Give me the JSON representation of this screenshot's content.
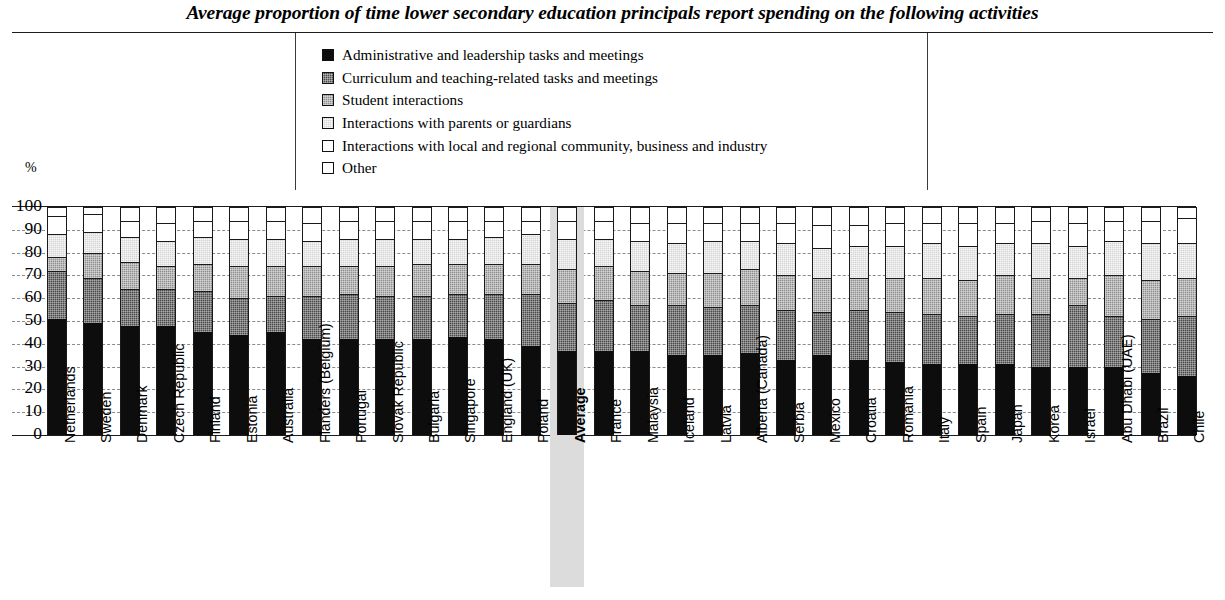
{
  "title": "Average proportion of time lower secondary education principals report spending on the following activities",
  "axis": {
    "y_unit": "%",
    "y_ticks": [
      "100",
      "90",
      "80",
      "70",
      "60",
      "50",
      "40",
      "30",
      "20",
      "10",
      "0"
    ]
  },
  "legend": {
    "items": [
      {
        "label": "Administrative and leadership tasks and meetings",
        "swatch": "black-filled-swatch",
        "color": "#0d0d0d"
      },
      {
        "label": "Curriculum and teaching-related tasks and meetings",
        "swatch": "dark-gray-hatch-swatch",
        "color": "#4a4a4a"
      },
      {
        "label": "Student interactions",
        "swatch": "medium-gray-hatch-swatch",
        "color": "#8e8e8e"
      },
      {
        "label": "Interactions with parents or guardians",
        "swatch": "light-gray-hatch-swatch",
        "color": "#d4d4d4"
      },
      {
        "label": "Interactions with local and regional community, business and industry",
        "swatch": "white-swatch",
        "color": "#ffffff"
      },
      {
        "label": "Other",
        "swatch": "white-swatch",
        "color": "#ffffff"
      }
    ]
  },
  "chart_data": {
    "type": "bar",
    "stacked": true,
    "title": "Average proportion of time lower secondary education principals report spending on the following activities",
    "xlabel": "",
    "ylabel": "%",
    "ylim": [
      0,
      100
    ],
    "yticks": [
      0,
      10,
      20,
      30,
      40,
      50,
      60,
      70,
      80,
      90,
      100
    ],
    "grid": true,
    "legend_position": "top-center",
    "highlight_category": "Average",
    "categories": [
      "Netherlands",
      "Sweden",
      "Denmark",
      "Czech Republic",
      "Finland",
      "Estonia",
      "Australia",
      "Flanders (Belgium)",
      "Portugal",
      "Slovak Republic",
      "Bulgaria",
      "Singapore",
      "England (UK)",
      "Poland",
      "Average",
      "France",
      "Malaysia",
      "Iceland",
      "Latvia",
      "Alberta (Canada)",
      "Serbia",
      "Mexico",
      "Croatia",
      "Romania",
      "Italy",
      "Spain",
      "Japan",
      "Korea",
      "Israel",
      "Abu Dhabi (UAE)",
      "Brazil",
      "Chile"
    ],
    "series": [
      {
        "name": "Administrative and leadership tasks and meetings",
        "color": "#0d0d0d",
        "values": [
          51,
          49,
          48,
          48,
          45,
          44,
          45,
          42,
          42,
          42,
          42,
          43,
          42,
          39,
          37,
          37,
          37,
          35,
          35,
          36,
          33,
          35,
          33,
          32,
          31,
          31,
          31,
          30,
          30,
          30,
          27,
          26
        ]
      },
      {
        "name": "Curriculum and teaching-related tasks and meetings",
        "color": "#4a4a4a",
        "values": [
          21,
          20,
          16,
          16,
          18,
          16,
          16,
          19,
          20,
          19,
          19,
          19,
          20,
          23,
          21,
          22,
          20,
          22,
          21,
          21,
          22,
          19,
          22,
          22,
          22,
          21,
          22,
          23,
          27,
          22,
          24,
          26
        ]
      },
      {
        "name": "Student interactions",
        "color": "#8e8e8e",
        "values": [
          6,
          11,
          12,
          10,
          12,
          14,
          13,
          13,
          12,
          13,
          14,
          13,
          13,
          13,
          15,
          15,
          15,
          14,
          15,
          16,
          15,
          15,
          14,
          15,
          16,
          16,
          17,
          16,
          12,
          18,
          17,
          17
        ]
      },
      {
        "name": "Interactions with parents or guardians",
        "color": "#d4d4d4",
        "values": [
          10,
          9,
          11,
          11,
          12,
          12,
          12,
          11,
          12,
          12,
          11,
          11,
          12,
          13,
          13,
          12,
          13,
          13,
          14,
          12,
          14,
          13,
          14,
          14,
          15,
          15,
          14,
          15,
          14,
          15,
          16,
          15
        ]
      },
      {
        "name": "Interactions with local and regional community, business and industry",
        "color": "#ffffff",
        "values": [
          8,
          8,
          7,
          8,
          7,
          8,
          8,
          8,
          8,
          8,
          8,
          8,
          7,
          6,
          8,
          8,
          8,
          9,
          8,
          8,
          9,
          10,
          9,
          10,
          9,
          10,
          9,
          10,
          10,
          9,
          10,
          11
        ]
      },
      {
        "name": "Other",
        "color": "#ffffff",
        "values": [
          4,
          3,
          6,
          7,
          6,
          6,
          6,
          7,
          6,
          6,
          6,
          6,
          6,
          6,
          6,
          6,
          7,
          7,
          7,
          7,
          7,
          8,
          8,
          7,
          7,
          7,
          7,
          6,
          7,
          6,
          6,
          5
        ]
      }
    ]
  }
}
